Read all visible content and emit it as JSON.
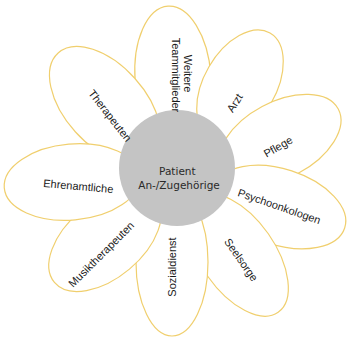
{
  "diagram": {
    "type": "flower",
    "center": {
      "lines": [
        "Patient",
        "An-/Zugehörige"
      ],
      "fill": "#c4c4c4"
    },
    "petal_stroke": "#f0cf6e",
    "petal_fill": "#ffffff",
    "petals": [
      {
        "id": "weitere-teammitglieder",
        "lines": [
          "Weitere",
          "Teammitglieder"
        ]
      },
      {
        "id": "arzt",
        "lines": [
          "Arzt"
        ]
      },
      {
        "id": "pflege",
        "lines": [
          "Pflege"
        ]
      },
      {
        "id": "psychoonkologen",
        "lines": [
          "Psychoonkologen"
        ]
      },
      {
        "id": "seelsorge",
        "lines": [
          "Seelsorge"
        ]
      },
      {
        "id": "sozialdienst",
        "lines": [
          "Sozialdienst"
        ]
      },
      {
        "id": "musiktherapeuten",
        "lines": [
          "Musiktherapeuten"
        ]
      },
      {
        "id": "ehrenamtliche",
        "lines": [
          "Ehrenamtliche"
        ]
      },
      {
        "id": "therapeuten",
        "lines": [
          "Therapeuten"
        ]
      }
    ]
  }
}
